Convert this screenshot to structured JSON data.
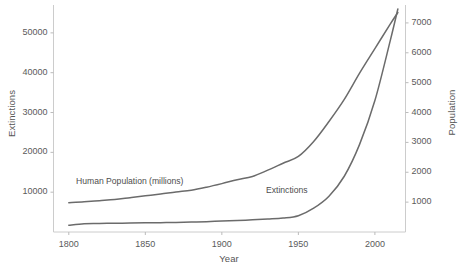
{
  "chart_data": {
    "type": "line",
    "title": "",
    "xlabel": "Year",
    "ylabel": "Extinctions",
    "y2label": "Population",
    "xlim": [
      1790,
      2020
    ],
    "ylim": [
      0,
      57000
    ],
    "y2lim": [
      0,
      7600
    ],
    "grid": false,
    "legend_position": "inline-annotations",
    "xticks": [
      1800,
      1850,
      1900,
      1950,
      2000
    ],
    "yticks": [
      10000,
      20000,
      30000,
      40000,
      50000
    ],
    "y2ticks": [
      1000,
      2000,
      3000,
      4000,
      5000,
      6000,
      7000
    ],
    "annotations": [
      {
        "text": "Human Population (millions)",
        "x": 1815,
        "y": 13500
      },
      {
        "text": "Extinctions",
        "x": 1945,
        "y": 5000
      }
    ],
    "series": [
      {
        "name": "Human Population (millions)",
        "axis": "right",
        "units": "millions",
        "color": "#6b6b6b",
        "x": [
          1800,
          1810,
          1820,
          1830,
          1840,
          1850,
          1860,
          1870,
          1880,
          1890,
          1900,
          1910,
          1920,
          1930,
          1940,
          1950,
          1960,
          1970,
          1980,
          1990,
          2000,
          2010,
          2015
        ],
        "values": [
          980,
          1010,
          1050,
          1090,
          1150,
          1210,
          1270,
          1340,
          1400,
          1500,
          1620,
          1750,
          1860,
          2070,
          2300,
          2530,
          3030,
          3700,
          4440,
          5320,
          6140,
          6960,
          7350
        ]
      },
      {
        "name": "Extinctions",
        "axis": "left",
        "units": "cumulative extinctions",
        "color": "#6b6b6b",
        "x": [
          1800,
          1810,
          1820,
          1830,
          1840,
          1850,
          1860,
          1870,
          1880,
          1890,
          1900,
          1910,
          1920,
          1930,
          1940,
          1950,
          1960,
          1970,
          1980,
          1990,
          2000,
          2010,
          2015
        ],
        "values": [
          1700,
          2100,
          2150,
          2200,
          2250,
          2300,
          2350,
          2400,
          2500,
          2600,
          2750,
          2900,
          3050,
          3250,
          3500,
          4100,
          6000,
          9000,
          14000,
          22000,
          33000,
          48000,
          56000
        ]
      }
    ]
  },
  "axes": {
    "left": {
      "title": "Extinctions",
      "ticks": [
        "50000",
        "40000",
        "30000",
        "20000",
        "10000"
      ]
    },
    "right": {
      "title": "Population",
      "ticks": [
        "7000",
        "6000",
        "5000",
        "4000",
        "3000",
        "2000",
        "1000"
      ]
    },
    "bottom": {
      "title": "Year",
      "ticks": [
        "1800",
        "1850",
        "1900",
        "1950",
        "2000"
      ]
    }
  },
  "series_labels": {
    "population": "Human Population (millions)",
    "extinctions": "Extinctions"
  },
  "colors": {
    "line": "#6b6b6b",
    "axis": "#cccccc",
    "text": "#555555",
    "background": "#ffffff"
  }
}
